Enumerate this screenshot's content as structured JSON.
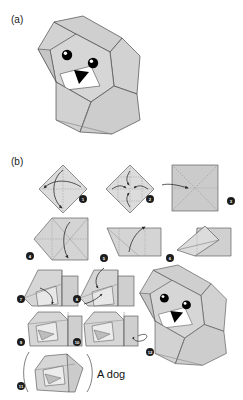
{
  "figure": {
    "panels": [
      {
        "id": "a",
        "label": "(a)",
        "description": "completed origami dog head model"
      },
      {
        "id": "b",
        "label": "(b)",
        "description": "eleven step folding diagram sequence"
      }
    ],
    "caption": "A dog"
  },
  "colors": {
    "paper_fill": "#d2d2d2",
    "paper_fill_light": "#e0e0e0",
    "paper_fill_dark": "#bcbcbc",
    "paper_white": "#ffffff",
    "outline": "#4a4a4a",
    "crease_line": "#9a9a9a",
    "arrow": "#2b2b2b",
    "eye": "#000000",
    "eye_highlight": "#ffffff",
    "nose": "#000000",
    "marker_fill": "#1d1d1d",
    "marker_text": "#ffffff",
    "background": "#ffffff",
    "text": "#1a1a1a"
  },
  "panel_a": {
    "name": "finished-dog",
    "alt": "Finished origami dog head with two floppy ears, two eyes and a black triangular nose"
  },
  "panel_b": {
    "steps": [
      {
        "number": "1",
        "label": "1",
        "name": "step-1",
        "shape": "diamond",
        "instruction": "fold square diagonally both ways to crease"
      },
      {
        "number": "2",
        "label": "2",
        "name": "step-2",
        "shape": "diamond",
        "instruction": "fold four corners to center"
      },
      {
        "number": "3",
        "label": "3",
        "name": "step-3",
        "shape": "square",
        "instruction": "turn over, square with diagonal creases"
      },
      {
        "number": "4",
        "label": "4",
        "name": "step-4",
        "shape": "pointed-square",
        "instruction": "fold left side to a point"
      },
      {
        "number": "5",
        "label": "5",
        "name": "step-5",
        "shape": "trapezoid",
        "instruction": "fold top edge down"
      },
      {
        "number": "6",
        "label": "6",
        "name": "step-6",
        "shape": "angular",
        "instruction": "pull out inner flap"
      },
      {
        "number": "7",
        "label": "7",
        "name": "step-7",
        "shape": "folded-left",
        "instruction": "fold ear flap down"
      },
      {
        "number": "8",
        "label": "8",
        "name": "step-8",
        "shape": "folded-left",
        "instruction": "fold second ear flap down"
      },
      {
        "number": "9",
        "label": "9",
        "name": "step-9",
        "shape": "head-form",
        "instruction": "shape the muzzle"
      },
      {
        "number": "10",
        "label": "10",
        "name": "step-10",
        "shape": "head-form",
        "instruction": "fold tail end under"
      },
      {
        "number": "11",
        "label": "11",
        "name": "step-11",
        "shape": "head-rotate",
        "instruction": "rotate the model"
      },
      {
        "number": "12",
        "label": "12",
        "name": "step-12",
        "shape": "finished-dog",
        "instruction": "finished dog"
      }
    ]
  }
}
